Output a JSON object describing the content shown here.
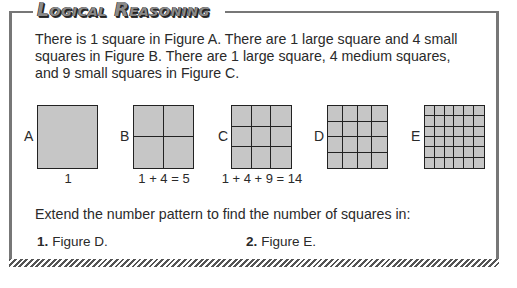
{
  "header": {
    "title": "Logical Reasoning"
  },
  "intro": {
    "line1": "There is 1 square in Figure A. There are 1 large square and 4 small",
    "line2": "squares in Figure B. There are 1 large square, 4 medium squares,",
    "line3": "and 9 small squares in Figure C."
  },
  "figures": [
    {
      "label": "A",
      "grid": 1,
      "caption": "1"
    },
    {
      "label": "B",
      "grid": 2,
      "caption": "1 + 4 = 5"
    },
    {
      "label": "C",
      "grid": 3,
      "caption": "1 + 4 + 9 = 14"
    },
    {
      "label": "D",
      "grid": 4,
      "caption": ""
    },
    {
      "label": "E",
      "grid": 6,
      "caption": ""
    }
  ],
  "question": "Extend the number pattern to find the number of squares in:",
  "items": [
    {
      "num": "1.",
      "text": "Figure D."
    },
    {
      "num": "2.",
      "text": "Figure E."
    }
  ],
  "colors": {
    "fill": "#c6c6c6",
    "border": "#777777"
  }
}
